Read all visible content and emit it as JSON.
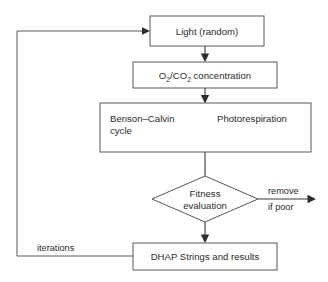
{
  "diagram": {
    "type": "flowchart",
    "colors": {
      "box_stroke": "#58585a",
      "line": "#3a3a3c",
      "text": "#2b2b2d",
      "background": "#ffffff"
    },
    "nodes": [
      {
        "id": "light",
        "shape": "rectangle",
        "label": "Light (random)"
      },
      {
        "id": "concentration",
        "shape": "rectangle",
        "label_parts": {
          "o": "O",
          "o_sub": "2",
          "slash": "/CO",
          "c_sub": "2",
          "tail": " concentration"
        },
        "label": "O2/CO2 concentration"
      },
      {
        "id": "processes",
        "shape": "rectangle",
        "label_left_line1": "Benson–Calvin",
        "label_left_line2": "cycle",
        "label_right": "Photorespiration"
      },
      {
        "id": "fitness",
        "shape": "diamond",
        "label_line1": "Fitness",
        "label_line2": "evaluation"
      },
      {
        "id": "dhap",
        "shape": "rectangle",
        "label": "DHAP Strings and results"
      }
    ],
    "edges": [
      {
        "id": "light-to-concentration",
        "from": "light",
        "to": "concentration",
        "label": ""
      },
      {
        "id": "concentration-to-processes",
        "from": "concentration",
        "to": "processes",
        "label": ""
      },
      {
        "id": "processes-to-fitness",
        "from": "processes",
        "to": "fitness",
        "label": ""
      },
      {
        "id": "fitness-to-dhap",
        "from": "fitness",
        "to": "dhap",
        "label": ""
      },
      {
        "id": "fitness-to-remove",
        "from": "fitness",
        "to": "exit",
        "label_line1": "remove",
        "label_line2": "if poor"
      },
      {
        "id": "dhap-to-light",
        "from": "dhap",
        "to": "light",
        "label": "iterations"
      }
    ]
  }
}
